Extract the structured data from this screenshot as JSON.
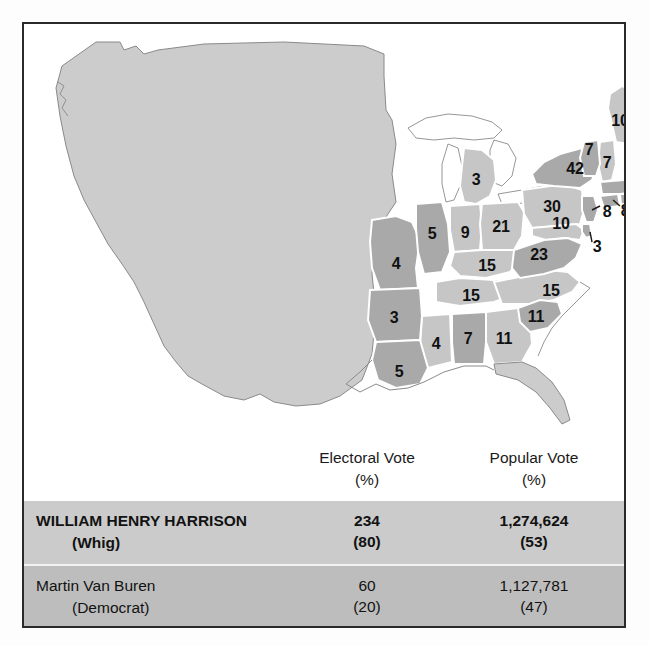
{
  "figure": {
    "title_text": "",
    "frame_color": "#2a2a2a",
    "whig_color": "#a9a9a9",
    "democrat_color": "#c6c6c6",
    "territory_color": "#cccccc"
  },
  "map": {
    "name": "united-states-1840-electoral-map",
    "states": [
      {
        "id": "maine",
        "label": "10",
        "x": 596,
        "y": 97,
        "party": "democrat"
      },
      {
        "id": "vermont",
        "label": "7",
        "x": 565,
        "y": 126,
        "party": "whig"
      },
      {
        "id": "new-hampshire",
        "label": "7",
        "x": 583,
        "y": 139,
        "party": "democrat"
      },
      {
        "id": "massachusetts",
        "label": "14",
        "x": 608,
        "y": 141,
        "party": "whig"
      },
      {
        "id": "rhode-island",
        "label": "4",
        "x": 613,
        "y": 173,
        "party": "whig"
      },
      {
        "id": "connecticut",
        "label": "8",
        "x": 601,
        "y": 187,
        "party": "whig"
      },
      {
        "id": "new-jersey",
        "label": "8",
        "x": 583,
        "y": 188,
        "party": "whig"
      },
      {
        "id": "new-york",
        "label": "42",
        "x": 551,
        "y": 145,
        "party": "whig"
      },
      {
        "id": "pennsylvania",
        "label": "30",
        "x": 528,
        "y": 183,
        "party": "democrat"
      },
      {
        "id": "maryland",
        "label": "10",
        "x": 537,
        "y": 200,
        "party": "democrat"
      },
      {
        "id": "delaware",
        "label": "3",
        "x": 573,
        "y": 223,
        "party": "whig"
      },
      {
        "id": "virginia",
        "label": "23",
        "x": 515,
        "y": 231,
        "party": "whig"
      },
      {
        "id": "north-carolina",
        "label": "15",
        "x": 527,
        "y": 267,
        "party": "democrat"
      },
      {
        "id": "south-carolina",
        "label": "11",
        "x": 512,
        "y": 293,
        "party": "whig"
      },
      {
        "id": "georgia",
        "label": "11",
        "x": 480,
        "y": 315,
        "party": "democrat"
      },
      {
        "id": "alabama",
        "label": "7",
        "x": 444,
        "y": 315,
        "party": "whig"
      },
      {
        "id": "mississippi",
        "label": "4",
        "x": 412,
        "y": 320,
        "party": "democrat"
      },
      {
        "id": "louisiana",
        "label": "5",
        "x": 375,
        "y": 348,
        "party": "whig"
      },
      {
        "id": "arkansas",
        "label": "3",
        "x": 370,
        "y": 294,
        "party": "whig"
      },
      {
        "id": "missouri",
        "label": "4",
        "x": 372,
        "y": 240,
        "party": "whig"
      },
      {
        "id": "tennessee",
        "label": "15",
        "x": 447,
        "y": 272,
        "party": "democrat"
      },
      {
        "id": "kentucky",
        "label": "15",
        "x": 463,
        "y": 242,
        "party": "democrat"
      },
      {
        "id": "illinois",
        "label": "5",
        "x": 408,
        "y": 210,
        "party": "whig"
      },
      {
        "id": "indiana",
        "label": "9",
        "x": 441,
        "y": 209,
        "party": "democrat"
      },
      {
        "id": "ohio",
        "label": "21",
        "x": 477,
        "y": 203,
        "party": "democrat"
      },
      {
        "id": "michigan",
        "label": "3",
        "x": 452,
        "y": 156,
        "party": "democrat"
      }
    ]
  },
  "table": {
    "headers": {
      "candidate": "",
      "electoral_line1": "Electoral Vote",
      "electoral_line2": "(%)",
      "popular_line1": "Popular Vote",
      "popular_line2": "(%)"
    },
    "rows": [
      {
        "name": "WILLIAM HENRY HARRISON",
        "party": "(Whig)",
        "electoral": "234",
        "electoral_pct": "(80)",
        "popular": "1,274,624",
        "popular_pct": "(53)",
        "winner": true
      },
      {
        "name": "Martin Van Buren",
        "party": "(Democrat)",
        "electoral": "60",
        "electoral_pct": "(20)",
        "popular": "1,127,781",
        "popular_pct": "(47)",
        "winner": false
      }
    ]
  }
}
